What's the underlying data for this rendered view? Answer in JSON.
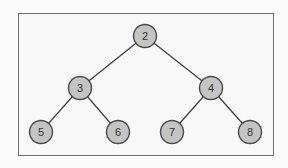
{
  "diagram": {
    "type": "binary-tree",
    "colors": {
      "node_fill": "#c4c4c4",
      "node_stroke": "#4a4a4a",
      "edge": "#3c3c3c",
      "frame": "#6e6e6e"
    },
    "nodes": [
      {
        "id": "n2",
        "label": "2",
        "x": 145,
        "y": 36
      },
      {
        "id": "n3",
        "label": "3",
        "x": 80,
        "y": 88
      },
      {
        "id": "n4",
        "label": "4",
        "x": 211,
        "y": 88
      },
      {
        "id": "n5",
        "label": "5",
        "x": 41,
        "y": 132
      },
      {
        "id": "n6",
        "label": "6",
        "x": 118,
        "y": 132
      },
      {
        "id": "n7",
        "label": "7",
        "x": 172,
        "y": 132
      },
      {
        "id": "n8",
        "label": "8",
        "x": 250,
        "y": 132
      }
    ],
    "edges": [
      {
        "from": "2",
        "to": "3"
      },
      {
        "from": "2",
        "to": "4"
      },
      {
        "from": "3",
        "to": "5"
      },
      {
        "from": "3",
        "to": "6"
      },
      {
        "from": "4",
        "to": "7"
      },
      {
        "from": "4",
        "to": "8"
      }
    ]
  }
}
